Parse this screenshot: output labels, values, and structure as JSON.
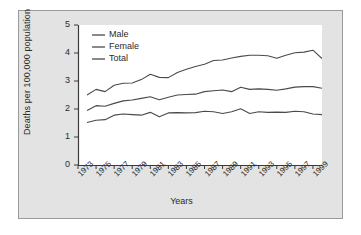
{
  "chart_data": {
    "type": "line",
    "title": "",
    "xlabel": "Years",
    "ylabel": "Deaths per 100,000 population",
    "ylim": [
      0,
      5
    ],
    "ytick_labels": [
      "0",
      "1",
      "2",
      "3",
      "4",
      "5"
    ],
    "yticks": [
      0,
      1,
      2,
      3,
      4,
      5
    ],
    "xlim": [
      1973,
      2000
    ],
    "xtick_labels": [
      "1973",
      "1975",
      "1977",
      "1979",
      "1981",
      "1983",
      "1985",
      "1987",
      "1989",
      "1991",
      "1993",
      "1995",
      "1997",
      "1999"
    ],
    "xticks": [
      1973,
      1975,
      1977,
      1979,
      1981,
      1983,
      1985,
      1987,
      1989,
      1991,
      1993,
      1995,
      1997,
      1999
    ],
    "grid": false,
    "legend_position": "upper-left",
    "x": [
      1974,
      1975,
      1976,
      1977,
      1978,
      1979,
      1980,
      1981,
      1982,
      1983,
      1984,
      1985,
      1986,
      1987,
      1988,
      1989,
      1990,
      1991,
      1992,
      1993,
      1994,
      1995,
      1996,
      1997,
      1998,
      1999,
      2000
    ],
    "series": [
      {
        "name": "Male",
        "color": "#4a4a4a",
        "values": [
          2.5,
          2.7,
          2.62,
          2.85,
          2.92,
          2.93,
          3.05,
          3.24,
          3.13,
          3.12,
          3.3,
          3.42,
          3.52,
          3.6,
          3.73,
          3.75,
          3.82,
          3.88,
          3.92,
          3.92,
          3.9,
          3.81,
          3.92,
          4.01,
          4.03,
          4.1,
          3.8
        ]
      },
      {
        "name": "Female",
        "color": "#4a4a4a",
        "values": [
          1.52,
          1.6,
          1.62,
          1.78,
          1.82,
          1.8,
          1.78,
          1.88,
          1.72,
          1.86,
          1.87,
          1.86,
          1.87,
          1.92,
          1.9,
          1.84,
          1.9,
          2.01,
          1.84,
          1.9,
          1.88,
          1.89,
          1.88,
          1.92,
          1.9,
          1.82,
          1.8
        ]
      },
      {
        "name": "Total",
        "color": "#4a4a4a",
        "values": [
          1.95,
          2.12,
          2.1,
          2.2,
          2.29,
          2.32,
          2.38,
          2.44,
          2.33,
          2.42,
          2.5,
          2.52,
          2.53,
          2.62,
          2.65,
          2.68,
          2.62,
          2.78,
          2.7,
          2.72,
          2.7,
          2.67,
          2.72,
          2.78,
          2.8,
          2.8,
          2.74
        ]
      }
    ]
  },
  "legend": {
    "items": [
      {
        "label": "Male"
      },
      {
        "label": "Female"
      },
      {
        "label": "Total"
      }
    ]
  }
}
